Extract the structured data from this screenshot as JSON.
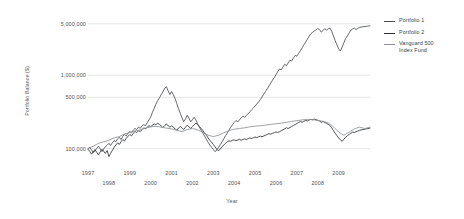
{
  "chart_data": {
    "type": "line",
    "title": "",
    "xlabel": "Year",
    "ylabel": "Portfolio Balance ($)",
    "yscale": "log",
    "ylim": [
      70000,
      6000000
    ],
    "xlim": [
      1997.0,
      2010.5
    ],
    "grid": true,
    "legend_position": "right",
    "yticks": [
      {
        "value": 5000000,
        "label": "5,000,000"
      },
      {
        "value": 1000000,
        "label": "1,000,000"
      },
      {
        "value": 500000,
        "label": "500,000"
      },
      {
        "value": 100000,
        "label": "100,000"
      }
    ],
    "xticks": [
      {
        "value": 1997,
        "label": "1997",
        "row": 0
      },
      {
        "value": 1998,
        "label": "1998",
        "row": 1
      },
      {
        "value": 1999,
        "label": "1999",
        "row": 0
      },
      {
        "value": 2000,
        "label": "2000",
        "row": 1
      },
      {
        "value": 2001,
        "label": "2001",
        "row": 0
      },
      {
        "value": 2002,
        "label": "2002",
        "row": 1
      },
      {
        "value": 2003,
        "label": "2003",
        "row": 0
      },
      {
        "value": 2004,
        "label": "2004",
        "row": 1
      },
      {
        "value": 2005,
        "label": "2005",
        "row": 0
      },
      {
        "value": 2006,
        "label": "2006",
        "row": 1
      },
      {
        "value": 2007,
        "label": "2007",
        "row": 0
      },
      {
        "value": 2008,
        "label": "2008",
        "row": 1
      },
      {
        "value": 2009,
        "label": "2009",
        "row": 0
      }
    ],
    "series": [
      {
        "name": "Portfolio 1",
        "color": "#4a4d51",
        "x": [
          1997.0,
          1997.08,
          1997.17,
          1997.25,
          1997.33,
          1997.42,
          1997.5,
          1997.58,
          1997.67,
          1997.75,
          1997.83,
          1997.92,
          1998.0,
          1998.08,
          1998.17,
          1998.25,
          1998.33,
          1998.42,
          1998.5,
          1998.58,
          1998.67,
          1998.75,
          1998.83,
          1998.92,
          1999.0,
          1999.08,
          1999.17,
          1999.25,
          1999.33,
          1999.42,
          1999.5,
          1999.58,
          1999.67,
          1999.75,
          1999.83,
          1999.92,
          2000.0,
          2000.08,
          2000.17,
          2000.25,
          2000.33,
          2000.42,
          2000.5,
          2000.58,
          2000.67,
          2000.75,
          2000.83,
          2000.92,
          2001.0,
          2001.08,
          2001.17,
          2001.25,
          2001.33,
          2001.42,
          2001.5,
          2001.58,
          2001.67,
          2001.75,
          2001.83,
          2001.92,
          2002.0,
          2002.08,
          2002.17,
          2002.25,
          2002.33,
          2002.42,
          2002.5,
          2002.58,
          2002.67,
          2002.75,
          2002.83,
          2002.92,
          2003.0,
          2003.08,
          2003.17,
          2003.25,
          2003.33,
          2003.42,
          2003.5,
          2003.58,
          2003.67,
          2003.75,
          2003.83,
          2003.92,
          2004.0,
          2004.08,
          2004.17,
          2004.25,
          2004.33,
          2004.42,
          2004.5,
          2004.58,
          2004.67,
          2004.75,
          2004.83,
          2004.92,
          2005.0,
          2005.08,
          2005.17,
          2005.25,
          2005.33,
          2005.42,
          2005.5,
          2005.58,
          2005.67,
          2005.75,
          2005.83,
          2005.92,
          2006.0,
          2006.08,
          2006.17,
          2006.25,
          2006.33,
          2006.42,
          2006.5,
          2006.58,
          2006.67,
          2006.75,
          2006.83,
          2006.92,
          2007.0,
          2007.08,
          2007.17,
          2007.25,
          2007.33,
          2007.42,
          2007.5,
          2007.58,
          2007.67,
          2007.75,
          2007.83,
          2007.92,
          2008.0,
          2008.08,
          2008.17,
          2008.25,
          2008.33,
          2008.42,
          2008.5,
          2008.58,
          2008.67,
          2008.75,
          2008.83,
          2008.92,
          2009.0,
          2009.08,
          2009.17,
          2009.25,
          2009.33,
          2009.42,
          2009.5,
          2009.58,
          2009.67,
          2009.75,
          2009.83,
          2009.92,
          2010.0,
          2010.17,
          2010.33,
          2010.5
        ],
        "y": [
          100000,
          104000,
          96000,
          88000,
          93000,
          101000,
          108000,
          99000,
          91000,
          99000,
          106000,
          112000,
          118000,
          110000,
          121000,
          129000,
          124000,
          136000,
          142000,
          133000,
          148000,
          156000,
          149000,
          163000,
          171000,
          164000,
          179000,
          188000,
          182000,
          196000,
          189000,
          203000,
          212000,
          205000,
          224000,
          246000,
          268000,
          310000,
          355000,
          402000,
          448000,
          492000,
          540000,
          590000,
          660000,
          700000,
          615000,
          545000,
          600000,
          545000,
          480000,
          410000,
          352000,
          300000,
          262000,
          232000,
          255000,
          285000,
          260000,
          232000,
          248000,
          268000,
          245000,
          218000,
          196000,
          178000,
          162000,
          148000,
          134000,
          122000,
          112000,
          104000,
          97000,
          91000,
          96000,
          104000,
          113000,
          124000,
          136000,
          149000,
          163000,
          178000,
          195000,
          212000,
          228000,
          241000,
          232000,
          246000,
          262000,
          278000,
          266000,
          282000,
          300000,
          318000,
          338000,
          358000,
          380000,
          404000,
          432000,
          466000,
          505000,
          552000,
          600000,
          655000,
          715000,
          780000,
          852000,
          930000,
          1015000,
          1110000,
          1215000,
          1180000,
          1290000,
          1410000,
          1340000,
          1465000,
          1600000,
          1560000,
          1705000,
          1860000,
          1810000,
          1980000,
          2160000,
          2360000,
          2580000,
          2820000,
          3080000,
          3360000,
          3670000,
          3830000,
          3980000,
          4150000,
          4320000,
          4180000,
          3850000,
          4050000,
          4290000,
          4100000,
          4280000,
          4380000,
          3950000,
          3420000,
          2950000,
          2580000,
          2280000,
          2130000,
          2420000,
          2760000,
          3140000,
          3440000,
          3760000,
          4080000,
          4260000,
          4380000,
          4160000,
          4340000,
          4480000,
          4560000,
          4620000,
          4700000
        ]
      },
      {
        "name": "Portfolio 2",
        "color": "#2e3134",
        "x": [
          1997.0,
          1997.08,
          1997.17,
          1997.25,
          1997.33,
          1997.42,
          1997.5,
          1997.58,
          1997.67,
          1997.75,
          1997.83,
          1997.92,
          1998.0,
          1998.08,
          1998.17,
          1998.25,
          1998.33,
          1998.42,
          1998.5,
          1998.58,
          1998.67,
          1998.75,
          1998.83,
          1998.92,
          1999.0,
          1999.08,
          1999.17,
          1999.25,
          1999.33,
          1999.42,
          1999.5,
          1999.58,
          1999.67,
          1999.75,
          1999.83,
          1999.92,
          2000.0,
          2000.08,
          2000.17,
          2000.25,
          2000.33,
          2000.42,
          2000.5,
          2000.58,
          2000.67,
          2000.75,
          2000.83,
          2000.92,
          2001.0,
          2001.08,
          2001.17,
          2001.25,
          2001.33,
          2001.42,
          2001.5,
          2001.58,
          2001.67,
          2001.75,
          2001.83,
          2001.92,
          2002.0,
          2002.08,
          2002.17,
          2002.25,
          2002.33,
          2002.42,
          2002.5,
          2002.58,
          2002.67,
          2002.75,
          2002.83,
          2002.92,
          2003.0,
          2003.08,
          2003.17,
          2003.25,
          2003.33,
          2003.42,
          2003.5,
          2003.58,
          2003.67,
          2003.75,
          2003.83,
          2003.92,
          2004.0,
          2004.08,
          2004.17,
          2004.25,
          2004.33,
          2004.42,
          2004.5,
          2004.58,
          2004.67,
          2004.75,
          2004.83,
          2004.92,
          2005.0,
          2005.08,
          2005.17,
          2005.25,
          2005.33,
          2005.42,
          2005.5,
          2005.58,
          2005.67,
          2005.75,
          2005.83,
          2005.92,
          2006.0,
          2006.08,
          2006.17,
          2006.25,
          2006.33,
          2006.42,
          2006.5,
          2006.58,
          2006.67,
          2006.75,
          2006.83,
          2006.92,
          2007.0,
          2007.08,
          2007.17,
          2007.25,
          2007.33,
          2007.42,
          2007.5,
          2007.58,
          2007.67,
          2007.75,
          2007.83,
          2007.92,
          2008.0,
          2008.08,
          2008.17,
          2008.25,
          2008.33,
          2008.42,
          2008.5,
          2008.58,
          2008.67,
          2008.75,
          2008.83,
          2008.92,
          2009.0,
          2009.08,
          2009.17,
          2009.25,
          2009.33,
          2009.42,
          2009.5,
          2009.58,
          2009.67,
          2009.75,
          2009.83,
          2009.92,
          2010.0,
          2010.17,
          2010.33,
          2010.5
        ],
        "y": [
          98000,
          92000,
          84000,
          90000,
          97000,
          89000,
          82000,
          90000,
          98000,
          92000,
          86000,
          94000,
          78000,
          86000,
          95000,
          104000,
          112000,
          120000,
          114000,
          124000,
          133000,
          127000,
          138000,
          148000,
          156000,
          149000,
          161000,
          172000,
          165000,
          176000,
          170000,
          181000,
          192000,
          185000,
          196000,
          205000,
          199000,
          208000,
          218000,
          210000,
          222000,
          214000,
          204000,
          194000,
          206000,
          216000,
          206000,
          196000,
          205000,
          196000,
          186000,
          178000,
          190000,
          200000,
          192000,
          182000,
          196000,
          208000,
          198000,
          188000,
          200000,
          212000,
          222000,
          212000,
          200000,
          188000,
          176000,
          164000,
          152000,
          140000,
          130000,
          122000,
          114000,
          106000,
          98000,
          93000,
          99000,
          106000,
          112000,
          118000,
          124000,
          128000,
          126000,
          130000,
          132000,
          128000,
          131000,
          134000,
          130000,
          133000,
          136000,
          133000,
          137000,
          140000,
          137000,
          141000,
          144000,
          141000,
          145000,
          148000,
          145000,
          149000,
          152000,
          156000,
          160000,
          157000,
          161000,
          165000,
          169000,
          166000,
          170000,
          175000,
          180000,
          186000,
          192000,
          188000,
          194000,
          200000,
          206000,
          213000,
          220000,
          227000,
          234000,
          228000,
          235000,
          242000,
          238000,
          245000,
          250000,
          246000,
          252000,
          248000,
          243000,
          238000,
          228000,
          234000,
          228000,
          220000,
          214000,
          206000,
          192000,
          176000,
          162000,
          150000,
          140000,
          132000,
          126000,
          134000,
          142000,
          150000,
          156000,
          162000,
          168000,
          165000,
          170000,
          174000,
          178000,
          182000,
          186000,
          190000
        ]
      },
      {
        "name": "Vanguard 500 Index Fund",
        "color": "#8e9195",
        "x": [
          1997.0,
          1997.25,
          1997.5,
          1997.75,
          1998.0,
          1998.25,
          1998.5,
          1998.75,
          1999.0,
          1999.25,
          1999.5,
          1999.75,
          2000.0,
          2000.25,
          2000.5,
          2000.75,
          2001.0,
          2001.25,
          2001.5,
          2001.75,
          2002.0,
          2002.25,
          2002.5,
          2002.75,
          2003.0,
          2003.25,
          2003.5,
          2003.75,
          2004.0,
          2004.25,
          2004.5,
          2004.75,
          2005.0,
          2005.25,
          2005.5,
          2005.75,
          2006.0,
          2006.25,
          2006.5,
          2006.75,
          2007.0,
          2007.25,
          2007.5,
          2007.75,
          2008.0,
          2008.25,
          2008.5,
          2008.75,
          2009.0,
          2009.25,
          2009.5,
          2009.75,
          2010.0,
          2010.25,
          2010.5
        ],
        "y": [
          100000,
          108000,
          118000,
          124000,
          130000,
          140000,
          146000,
          158000,
          166000,
          174000,
          180000,
          190000,
          198000,
          202000,
          196000,
          190000,
          186000,
          178000,
          170000,
          182000,
          188000,
          180000,
          166000,
          152000,
          146000,
          152000,
          164000,
          176000,
          184000,
          188000,
          192000,
          198000,
          202000,
          205000,
          209000,
          214000,
          218000,
          222000,
          228000,
          235000,
          240000,
          246000,
          250000,
          248000,
          242000,
          236000,
          224000,
          198000,
          168000,
          152000,
          168000,
          186000,
          196000,
          188000,
          196000
        ]
      }
    ]
  },
  "legend": {
    "items": [
      {
        "label": "Portfolio 1",
        "label2": "",
        "color": "#4a4d51"
      },
      {
        "label": "Portfolio 2",
        "label2": "",
        "color": "#2e3134"
      },
      {
        "label": "Vanguard 500",
        "label2": "Index Fund",
        "color": "#8e9195"
      }
    ]
  }
}
